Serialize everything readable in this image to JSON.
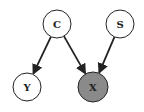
{
  "diagram": {
    "type": "directed-graphical-model",
    "nodes": [
      {
        "id": "C",
        "label": "C",
        "cx": 57,
        "cy": 24,
        "r": 14,
        "fill": "#ffffff",
        "observed": false
      },
      {
        "id": "S",
        "label": "S",
        "cx": 120,
        "cy": 24,
        "r": 14,
        "fill": "#ffffff",
        "observed": false
      },
      {
        "id": "Y",
        "label": "Y",
        "cx": 27,
        "cy": 87,
        "r": 14,
        "fill": "#ffffff",
        "observed": false
      },
      {
        "id": "X",
        "label": "X",
        "cx": 93,
        "cy": 87,
        "r": 15,
        "fill": "#8a8a8a",
        "observed": true
      }
    ],
    "edges": [
      {
        "from": "C",
        "to": "Y"
      },
      {
        "from": "C",
        "to": "X"
      },
      {
        "from": "S",
        "to": "X"
      }
    ],
    "colors": {
      "stroke": "#222222",
      "observed_fill": "#8a8a8a",
      "background": "#ffffff"
    }
  }
}
